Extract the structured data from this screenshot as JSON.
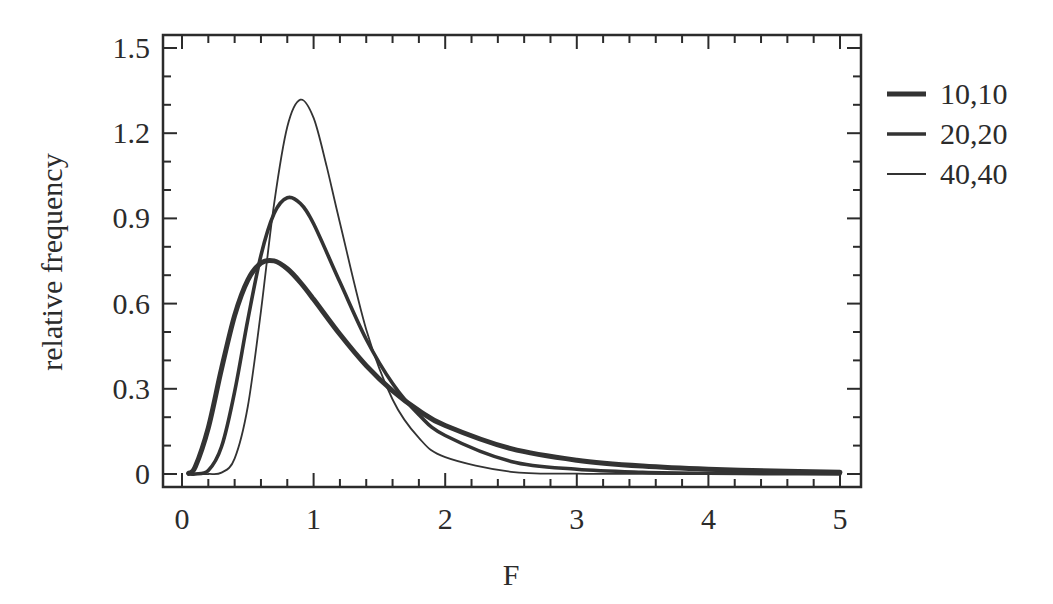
{
  "chart_data": {
    "type": "line",
    "title": "",
    "xlabel": "F",
    "ylabel": "relative frequency",
    "xlim": [
      0,
      5
    ],
    "ylim": [
      0,
      1.5
    ],
    "x_ticks": [
      0,
      1,
      2,
      3,
      4,
      5
    ],
    "x_tick_labels": [
      "0",
      "1",
      "2",
      "3",
      "4",
      "5"
    ],
    "x_minor_step": 0.2,
    "y_ticks": [
      0,
      0.3,
      0.6,
      0.9,
      1.2,
      1.5
    ],
    "y_tick_labels": [
      "0",
      "0.3",
      "0.6",
      "0.9",
      "1.2",
      "1.5"
    ],
    "y_minor_step": 0.1,
    "grid": false,
    "legend_position": "right-outside-top",
    "series": [
      {
        "name": "10,10",
        "weight": "thick",
        "color": "#333333",
        "x": [
          0.05,
          0.1,
          0.2,
          0.3,
          0.4,
          0.5,
          0.6,
          0.7,
          0.8,
          0.9,
          1.0,
          1.2,
          1.4,
          1.6,
          1.8,
          2.0,
          2.5,
          3.0,
          3.5,
          4.0,
          4.5,
          5.0
        ],
        "y": [
          0.0024,
          0.0243,
          0.1628,
          0.3702,
          0.5576,
          0.6828,
          0.7426,
          0.7503,
          0.7227,
          0.6742,
          0.6152,
          0.4918,
          0.3817,
          0.2925,
          0.2233,
          0.1707,
          0.0892,
          0.0487,
          0.0278,
          0.0165,
          0.0102,
          0.0065
        ]
      },
      {
        "name": "20,20",
        "weight": "medium",
        "color": "#333333",
        "x": [
          0.05,
          0.1,
          0.2,
          0.3,
          0.4,
          0.5,
          0.6,
          0.7,
          0.8,
          0.9,
          1.0,
          1.2,
          1.4,
          1.6,
          1.8,
          2.0,
          2.5,
          3.0,
          3.5,
          4.0,
          4.5,
          5.0
        ],
        "y": [
          0.0,
          0.0003,
          0.0123,
          0.0957,
          0.2894,
          0.5426,
          0.7701,
          0.9172,
          0.9726,
          0.9521,
          0.881,
          0.6757,
          0.4748,
          0.3186,
          0.2089,
          0.1356,
          0.0442,
          0.0165,
          0.0061,
          0.0025,
          0.0011,
          0.0005
        ]
      },
      {
        "name": "40,40",
        "weight": "thin",
        "color": "#333333",
        "x": [
          0.05,
          0.1,
          0.2,
          0.3,
          0.4,
          0.5,
          0.6,
          0.7,
          0.8,
          0.9,
          1.0,
          1.1,
          1.2,
          1.4,
          1.6,
          1.8,
          2.0,
          2.5,
          3.0,
          3.5,
          4.0,
          4.5,
          5.0
        ],
        "y": [
          0.0,
          0.0,
          0.0001,
          0.0051,
          0.0541,
          0.2378,
          0.5747,
          0.9512,
          1.2224,
          1.3179,
          1.2537,
          1.0813,
          0.885,
          0.5093,
          0.2623,
          0.1271,
          0.0594,
          0.0079,
          0.0013,
          0.0002,
          0.0,
          0.0,
          0.0
        ]
      }
    ]
  }
}
